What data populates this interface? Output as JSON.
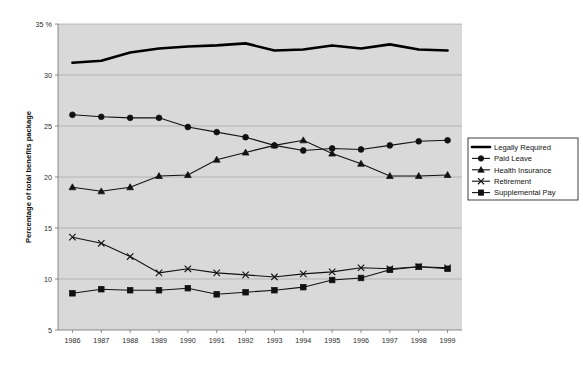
{
  "chart_data": {
    "type": "line",
    "title": "",
    "xlabel": "",
    "ylabel": "Percentage of total benefits package",
    "y_unit_suffix": "%",
    "categories": [
      "1986",
      "1987",
      "1988",
      "1989",
      "1990",
      "1991",
      "1992",
      "1993",
      "1994",
      "1995",
      "1996",
      "1997",
      "1998",
      "1999"
    ],
    "ylim": [
      5,
      35
    ],
    "ytick_values": [
      5,
      10,
      15,
      20,
      25,
      30,
      35
    ],
    "ytick_labels": [
      "5",
      "10",
      "15",
      "20",
      "25",
      "30",
      "35 %"
    ],
    "grid": true,
    "legend_position": "right",
    "plot_background": "#d9d9d9",
    "page_background": "#ffffff",
    "series_color": "#111111",
    "series": [
      {
        "name": "Legally Required",
        "marker": "none",
        "line_style": "thick",
        "values": [
          31.2,
          31.4,
          32.2,
          32.6,
          32.8,
          32.9,
          33.1,
          32.4,
          32.5,
          32.9,
          32.6,
          33.0,
          32.5,
          32.4
        ]
      },
      {
        "name": "Paid Leave",
        "marker": "circle",
        "line_style": "thin",
        "values": [
          26.1,
          25.9,
          25.8,
          25.8,
          24.9,
          24.4,
          23.9,
          23.1,
          22.6,
          22.8,
          22.7,
          23.1,
          23.5,
          23.6
        ]
      },
      {
        "name": "Health Insurance",
        "marker": "triangle",
        "line_style": "thin",
        "values": [
          19.0,
          18.6,
          19.0,
          20.1,
          20.2,
          21.7,
          22.4,
          23.1,
          23.6,
          22.3,
          21.3,
          20.1,
          20.1,
          20.2
        ]
      },
      {
        "name": "Retirement",
        "marker": "cross",
        "line_style": "thin",
        "values": [
          14.1,
          13.5,
          12.2,
          10.6,
          11.0,
          10.6,
          10.4,
          10.2,
          10.5,
          10.7,
          11.1,
          11.0,
          11.2,
          11.1
        ]
      },
      {
        "name": "Supplemental Pay",
        "marker": "square",
        "line_style": "thin",
        "values": [
          8.6,
          9.0,
          8.9,
          8.9,
          9.1,
          8.5,
          8.7,
          8.9,
          9.2,
          9.9,
          10.1,
          10.9,
          11.2,
          11.0
        ]
      }
    ]
  },
  "legend": {
    "items": [
      {
        "label": "Legally Required"
      },
      {
        "label": "Paid Leave"
      },
      {
        "label": "Health Insurance"
      },
      {
        "label": "Retirement"
      },
      {
        "label": "Supplemental Pay"
      }
    ]
  }
}
